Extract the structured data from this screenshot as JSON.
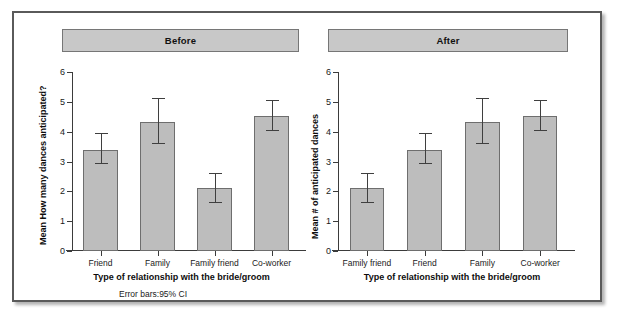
{
  "chart_data": [
    {
      "type": "bar",
      "title": "Before",
      "panel_id": "before",
      "categories": [
        "Friend",
        "Family",
        "Family friend",
        "Co-worker"
      ],
      "values": [
        3.38,
        4.33,
        2.11,
        4.52
      ],
      "ci_lower": [
        2.9,
        3.58,
        1.6,
        4.03
      ],
      "ci_upper": [
        3.95,
        5.13,
        2.63,
        5.05
      ],
      "error_bar_type": "95% CI",
      "xlabel": "Type of relationship with the bride/groom",
      "ylabel": "Mean How many dances anticipated?",
      "ylim": [
        0,
        6
      ],
      "yticks": [
        0,
        1,
        2,
        3,
        4,
        5,
        6
      ],
      "ytick_labels": [
        "0",
        "1",
        "2",
        "3",
        "4",
        "5",
        "6"
      ],
      "grid": false,
      "legend": "none"
    },
    {
      "type": "bar",
      "title": "After",
      "panel_id": "after",
      "categories": [
        "Family friend",
        "Friend",
        "Family",
        "Co-worker"
      ],
      "values": [
        2.11,
        3.38,
        4.33,
        4.52
      ],
      "ci_lower": [
        1.6,
        2.9,
        3.58,
        4.03
      ],
      "ci_upper": [
        2.63,
        3.95,
        5.13,
        5.05
      ],
      "error_bar_type": "95% CI",
      "xlabel": "Type of relationship with the bride/groom",
      "ylabel": "Mean # of anticipated dances",
      "ylim": [
        0,
        6
      ],
      "yticks": [
        0,
        1,
        2,
        3,
        4,
        5,
        6
      ],
      "ytick_labels": [
        "0",
        "1",
        "2",
        "3",
        "4",
        "5",
        "6"
      ],
      "grid": false,
      "legend": "none"
    }
  ],
  "annotations": {
    "error_bars_note": "Error bars:95% CI"
  },
  "colors": {
    "bar_fill": "#bdbdbd",
    "bar_stroke": "#6e6e6e",
    "header_fill": "#c8c8c8",
    "axis": "#3b3b3b",
    "frame": "#5a5a5a",
    "background": "#ffffff"
  }
}
